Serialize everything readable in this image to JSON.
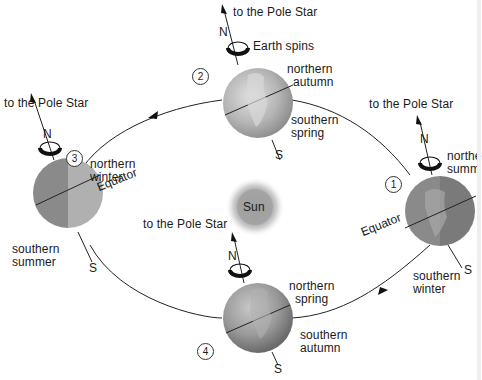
{
  "diagram": {
    "center": {
      "label": "Sun"
    },
    "pole_star_label": "to the Pole Star",
    "north_label": "N",
    "south_label": "S",
    "spin_label": "Earth spins",
    "equator_label": "Equator",
    "positions": [
      {
        "number": "1",
        "north_season": "northern summer",
        "north_season_visible": "northe\nsumm",
        "south_season": "southern winter"
      },
      {
        "number": "2",
        "north_season": "northern autumn",
        "south_season": "southern spring"
      },
      {
        "number": "3",
        "north_season": "northern winter",
        "south_season": "southern summer"
      },
      {
        "number": "4",
        "north_season": "northern spring",
        "south_season": "southern autumn"
      }
    ],
    "labels": {
      "p1_north_l1": "northe",
      "p1_north_l2": "summ",
      "p1_south_l1": "southern",
      "p1_south_l2": "winter",
      "p2_north_l1": "northern",
      "p2_north_l2": "autumn",
      "p2_south_l1": "southern",
      "p2_south_l2": "spring",
      "p3_north_l1": "northern",
      "p3_north_l2": "winter",
      "p3_south_l1": "southern",
      "p3_south_l2": "summer",
      "p4_north_l1": "northern",
      "p4_north_l2": "spring",
      "p4_south_l1": "southern",
      "p4_south_l2": "autumn"
    },
    "colors": {
      "globe_dark": "#6e6e6e",
      "globe_light": "#bdbdbd",
      "sun_core": "#9a9a9a",
      "sun_glow": "#e6e6e6",
      "orbit": "#222222"
    }
  }
}
